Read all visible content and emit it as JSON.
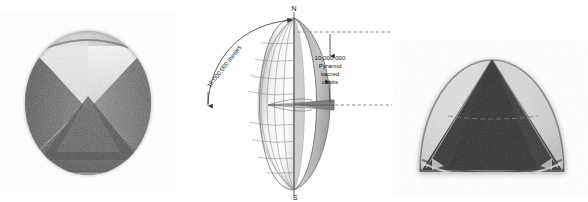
{
  "figure": {
    "title": "",
    "background_color": "#ffffff",
    "panels": [
      {
        "id": "left",
        "name": "sphere-with-inscribed-pyramid-top-view",
        "caption": "",
        "description": "Photograph of a stone sphere with a four-sided pyramid inscribed, viewed from above showing square base corners"
      },
      {
        "id": "middle",
        "name": "cutaway-globe-diagram",
        "caption": "",
        "description": "Line diagram of a cut-away globe with latitude and longitude grid, equatorial plane wedge, polar axis and measurement callouts"
      },
      {
        "id": "right",
        "name": "hemisphere-with-inscribed-pyramid-side-view",
        "caption": "",
        "description": "Photograph of a dome/hemisphere with a dark pyramid inscribed, viewed from the side"
      }
    ]
  },
  "globe": {
    "pole_north_label": "N",
    "pole_south_label": "S",
    "arc_label": "10,000,000 meters",
    "height_label_lines": [
      "10,000,000",
      "Pyramid",
      "sacred",
      "cubits"
    ],
    "grid": {
      "meridian_count": 7,
      "parallel_count": 9,
      "show_equatorial_plane": true
    },
    "colors": {
      "line": "#4a4a4a",
      "grid": "#8d8d8d",
      "shade_light": "#f2f2f2",
      "shade_mid": "#cfcfcf",
      "shade_dark": "#9a9a9a",
      "shade_darkest": "#6d6d6d",
      "dash": "#555555",
      "text": "#1a1a1a"
    }
  },
  "photos": {
    "left": {
      "alt": "Stone sphere with inscribed pyramid seen from above",
      "tone_dark": "#2b2b2b",
      "tone_mid": "#9e9e9e",
      "tone_light": "#ededed"
    },
    "right": {
      "alt": "Stone dome with inscribed dark pyramid seen from the side",
      "tone_dark": "#141414",
      "tone_mid": "#8a8a8a",
      "tone_light": "#efefef"
    }
  }
}
